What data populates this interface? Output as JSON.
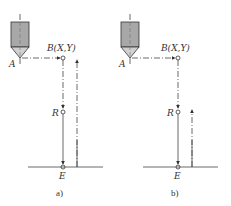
{
  "diagram": {
    "panels": [
      {
        "id": "a",
        "caption": "a)",
        "labels": {
          "start": "A",
          "point_b": "B(X,Y)",
          "point_r": "R",
          "point_e": "E"
        },
        "description": "Tool moves A to B rapid, rapid down to R, feed down to E, then returns to B level"
      },
      {
        "id": "b",
        "caption": "b)",
        "labels": {
          "start": "A",
          "point_b": "B(X,Y)",
          "point_r": "R",
          "point_e": "E"
        },
        "description": "Tool moves A to B rapid, rapid down to R, feed down to E, then returns to R level"
      }
    ],
    "colors": {
      "line": "#444444",
      "tool_body": "#a8a8a8",
      "tool_tip": "#d0d0d0"
    }
  }
}
